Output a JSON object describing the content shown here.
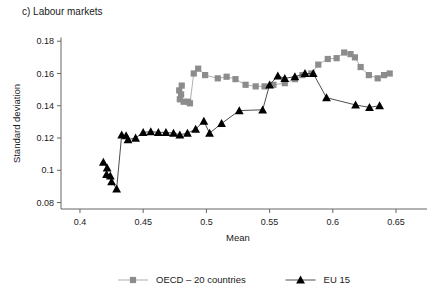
{
  "figure": {
    "panel_title": "c) Labour markets"
  },
  "chart_data": {
    "type": "scatter",
    "title": "c) Labour markets",
    "xlabel": "Mean",
    "ylabel": "Standard deviation",
    "xlim": [
      0.385,
      0.665
    ],
    "ylim": [
      0.076,
      0.182
    ],
    "xticks": [
      0.4,
      0.45,
      0.5,
      0.55,
      0.6,
      0.65
    ],
    "xticklabels": [
      "0.4",
      "0.45",
      "0.5",
      "0.55",
      "0.6",
      "0.65"
    ],
    "yticks": [
      0.08,
      0.1,
      0.12,
      0.14,
      0.16,
      0.18
    ],
    "yticklabels": [
      "0.08",
      "0.1",
      "0.12",
      "0.14",
      "0.16",
      "0.18"
    ],
    "grid": false,
    "legend_position": "bottom",
    "connected": true,
    "series": [
      {
        "name": "OECD – 20 countries",
        "marker": "square",
        "color": "#8c8c8c",
        "line_color": "#a6a6a6",
        "points": [
          [
            0.4805,
            0.1525
          ],
          [
            0.4785,
            0.1495
          ],
          [
            0.48,
            0.147
          ],
          [
            0.479,
            0.144
          ],
          [
            0.482,
            0.1425
          ],
          [
            0.4855,
            0.1425
          ],
          [
            0.487,
            0.1415
          ],
          [
            0.49,
            0.16
          ],
          [
            0.4935,
            0.163
          ],
          [
            0.499,
            0.159
          ],
          [
            0.509,
            0.157
          ],
          [
            0.516,
            0.158
          ],
          [
            0.523,
            0.1565
          ],
          [
            0.531,
            0.153
          ],
          [
            0.539,
            0.152
          ],
          [
            0.546,
            0.152
          ],
          [
            0.553,
            0.153
          ],
          [
            0.562,
            0.154
          ],
          [
            0.57,
            0.1565
          ],
          [
            0.576,
            0.159
          ],
          [
            0.583,
            0.16
          ],
          [
            0.5885,
            0.1655
          ],
          [
            0.596,
            0.169
          ],
          [
            0.603,
            0.1695
          ],
          [
            0.609,
            0.173
          ],
          [
            0.614,
            0.172
          ],
          [
            0.6175,
            0.17
          ],
          [
            0.622,
            0.164
          ],
          [
            0.6285,
            0.159
          ],
          [
            0.6355,
            0.157
          ],
          [
            0.6405,
            0.159
          ],
          [
            0.645,
            0.16
          ]
        ]
      },
      {
        "name": "EU 15",
        "marker": "triangle",
        "color": "#000000",
        "line_color": "#3a3a3a",
        "points": [
          [
            0.4185,
            0.105
          ],
          [
            0.4215,
            0.1015
          ],
          [
            0.421,
            0.0975
          ],
          [
            0.424,
            0.0965
          ],
          [
            0.425,
            0.093
          ],
          [
            0.429,
            0.0885
          ],
          [
            0.433,
            0.122
          ],
          [
            0.4365,
            0.1215
          ],
          [
            0.438,
            0.119
          ],
          [
            0.444,
            0.12
          ],
          [
            0.45,
            0.1235
          ],
          [
            0.456,
            0.124
          ],
          [
            0.462,
            0.1235
          ],
          [
            0.468,
            0.1235
          ],
          [
            0.474,
            0.123
          ],
          [
            0.479,
            0.122
          ],
          [
            0.485,
            0.123
          ],
          [
            0.4915,
            0.1255
          ],
          [
            0.498,
            0.1305
          ],
          [
            0.5025,
            0.123
          ],
          [
            0.512,
            0.129
          ],
          [
            0.526,
            0.137
          ],
          [
            0.5445,
            0.1375
          ],
          [
            0.55,
            0.153
          ],
          [
            0.5565,
            0.1585
          ],
          [
            0.562,
            0.157
          ],
          [
            0.57,
            0.158
          ],
          [
            0.578,
            0.16
          ],
          [
            0.5845,
            0.16
          ],
          [
            0.595,
            0.145
          ],
          [
            0.618,
            0.1405
          ],
          [
            0.629,
            0.139
          ],
          [
            0.637,
            0.14
          ]
        ]
      }
    ]
  }
}
